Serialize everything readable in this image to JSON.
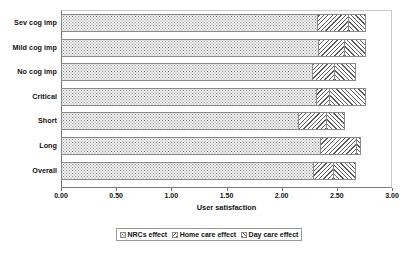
{
  "chart_data": {
    "type": "bar",
    "subtype": "horizontal-stacked",
    "title": "",
    "xlabel": "User satisfaction",
    "ylabel": "",
    "xlim": [
      0.0,
      3.0
    ],
    "xticks": [
      "0.00",
      "0.50",
      "1.00",
      "1.50",
      "2.00",
      "2.50",
      "3.00"
    ],
    "xtick_values": [
      0.0,
      0.5,
      1.0,
      1.5,
      2.0,
      2.5,
      3.0
    ],
    "grid": false,
    "legend_position": "bottom",
    "categories": [
      "Sev cog imp",
      "Mild cog imp",
      "No cog imp",
      "Critical",
      "Short",
      "Long",
      "Overall"
    ],
    "series": [
      {
        "name": "NRCs effect",
        "pattern": "fine-dots",
        "values": [
          2.33,
          2.34,
          2.28,
          2.32,
          2.16,
          2.36,
          2.29
        ]
      },
      {
        "name": "Home care effect",
        "pattern": "back-hatch",
        "values": [
          0.28,
          0.23,
          0.2,
          0.12,
          0.25,
          0.32,
          0.18
        ]
      },
      {
        "name": "Day care effect",
        "pattern": "forward-hatch",
        "values": [
          0.15,
          0.19,
          0.19,
          0.32,
          0.16,
          0.04,
          0.2
        ]
      }
    ],
    "totals": [
      2.76,
      2.76,
      2.67,
      2.76,
      2.57,
      2.72,
      2.67
    ],
    "colors": {
      "nrcs_effect": "#f3f3f3",
      "home_care_effect": "#ffffff",
      "day_care_effect": "#ffffff",
      "outline": "#8a8a8a",
      "axis": "#7a7a7a",
      "text": "#111111",
      "background": "#ffffff"
    }
  },
  "legend": {
    "items": [
      {
        "label": "NRCs effect"
      },
      {
        "label": "Home care effect"
      },
      {
        "label": "Day care effect"
      }
    ]
  }
}
